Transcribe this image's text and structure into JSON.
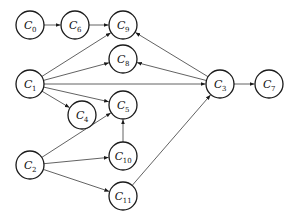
{
  "diagram": {
    "type": "directed-graph",
    "node_radius": 14,
    "nodes": [
      {
        "id": "C0",
        "letter": "C",
        "sub": "0",
        "x": 30,
        "y": 25
      },
      {
        "id": "C6",
        "letter": "C",
        "sub": "6",
        "x": 75,
        "y": 25
      },
      {
        "id": "C9",
        "letter": "C",
        "sub": "9",
        "x": 123,
        "y": 25
      },
      {
        "id": "C8",
        "letter": "C",
        "sub": "8",
        "x": 123,
        "y": 59
      },
      {
        "id": "C1",
        "letter": "C",
        "sub": "1",
        "x": 30,
        "y": 84
      },
      {
        "id": "C4",
        "letter": "C",
        "sub": "4",
        "x": 82,
        "y": 115
      },
      {
        "id": "C5",
        "letter": "C",
        "sub": "5",
        "x": 123,
        "y": 105
      },
      {
        "id": "C2",
        "letter": "C",
        "sub": "2",
        "x": 30,
        "y": 165
      },
      {
        "id": "C10",
        "letter": "C",
        "sub": "10",
        "x": 123,
        "y": 156
      },
      {
        "id": "C11",
        "letter": "C",
        "sub": "11",
        "x": 123,
        "y": 196
      },
      {
        "id": "C3",
        "letter": "C",
        "sub": "3",
        "x": 220,
        "y": 84
      },
      {
        "id": "C7",
        "letter": "C",
        "sub": "7",
        "x": 269,
        "y": 84
      }
    ],
    "edges": [
      {
        "from": "C0",
        "to": "C6"
      },
      {
        "from": "C6",
        "to": "C9"
      },
      {
        "from": "C1",
        "to": "C9"
      },
      {
        "from": "C1",
        "to": "C8"
      },
      {
        "from": "C1",
        "to": "C3"
      },
      {
        "from": "C1",
        "to": "C4"
      },
      {
        "from": "C1",
        "to": "C5"
      },
      {
        "from": "C3",
        "to": "C9"
      },
      {
        "from": "C3",
        "to": "C8"
      },
      {
        "from": "C3",
        "to": "C7"
      },
      {
        "from": "C2",
        "to": "C5"
      },
      {
        "from": "C2",
        "to": "C10"
      },
      {
        "from": "C2",
        "to": "C11"
      },
      {
        "from": "C10",
        "to": "C5"
      },
      {
        "from": "C11",
        "to": "C3"
      }
    ]
  }
}
